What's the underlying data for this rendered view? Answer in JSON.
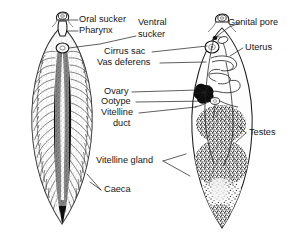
{
  "figure": {
    "background_color": "#ffffff",
    "ink_color": "#161616",
    "specimens": [
      {
        "id": "left-specimen",
        "name": "digestive-system-view",
        "description": "Whole mount showing branched intestinal caeca"
      },
      {
        "id": "right-specimen",
        "name": "reproductive-system-view",
        "description": "Whole mount showing reproductive organs, uterus, testes and vitelline glands"
      }
    ]
  },
  "labels": {
    "oral_sucker": "Oral sucker",
    "pharynx": "Pharynx",
    "ventral_sucker_line1": "Ventral",
    "ventral_sucker_line2": "sucker",
    "cirrus_sac": "Cirrus sac",
    "vas_deferens": "Vas deferens",
    "ovary": "Ovary",
    "ootype": "Ootype",
    "vitelline_duct_line1": "Vitelline",
    "vitelline_duct_line2": "duct",
    "vitelline_gland": "Vitelline gland",
    "caeca": "Caeca",
    "genital_pore": "Genital pore",
    "uterus": "Uterus",
    "testes": "Testes"
  }
}
